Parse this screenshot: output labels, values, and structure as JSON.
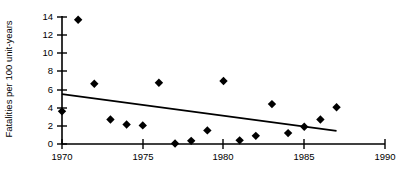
{
  "chart_data": {
    "type": "scatter",
    "title": "",
    "xlabel": "",
    "ylabel": "Fatalities per 100 unit-years",
    "xlim": [
      1970,
      1990
    ],
    "ylim": [
      0,
      14
    ],
    "grid": false,
    "legend": false,
    "xticks": [
      1970,
      1975,
      1980,
      1985,
      1990
    ],
    "xtick_labels": [
      "1970",
      "1975",
      "1980",
      "1985",
      "1990"
    ],
    "yticks": [
      0,
      2,
      4,
      6,
      8,
      10,
      12,
      14
    ],
    "ytick_labels": [
      "0",
      "2",
      "4",
      "6",
      "8",
      "10",
      "12",
      "14"
    ],
    "marker": "diamond",
    "marker_color": "#000000",
    "series": [
      {
        "name": "Fatalities per 100 unit-years",
        "x": [
          1970,
          1971,
          1972,
          1973,
          1974,
          1975,
          1976,
          1977,
          1978,
          1979,
          1980,
          1981,
          1982,
          1983,
          1984,
          1985,
          1986,
          1987
        ],
        "y": [
          3.6,
          13.7,
          6.65,
          2.7,
          2.15,
          2.05,
          6.75,
          0.05,
          0.35,
          1.5,
          6.95,
          0.4,
          0.9,
          4.4,
          1.2,
          1.9,
          2.7,
          4.05
        ]
      }
    ],
    "trendline": {
      "type": "line",
      "color": "#000000",
      "x": [
        1970,
        1987
      ],
      "y": [
        5.5,
        1.45
      ]
    }
  }
}
